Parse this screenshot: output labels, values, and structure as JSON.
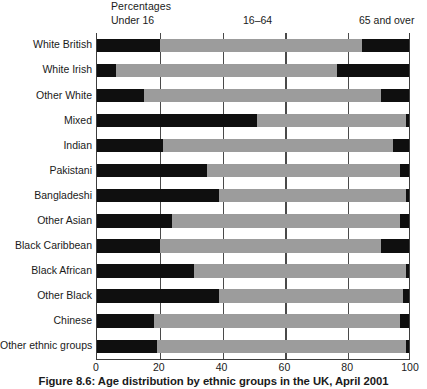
{
  "header": {
    "percentages_label": "Percentages",
    "band_labels": [
      "Under 16",
      "16–64",
      "65 and over"
    ]
  },
  "caption": "Figure 8.6: Age distribution by ethnic groups in the UK, April 2001",
  "colors": {
    "under16": "#0f0f0f",
    "age16to64": "#9c9c9c",
    "over65": "#0f0f0f",
    "axis": "#3d3d3d",
    "background": "#ffffff"
  },
  "chart_data": {
    "type": "bar",
    "orientation": "horizontal",
    "stacked": true,
    "title": "Figure 8.6: Age distribution by ethnic groups in the UK, April 2001",
    "xlabel": "Percentages",
    "ylabel": "",
    "xlim": [
      0,
      100
    ],
    "xticks": [
      0,
      20,
      40,
      60,
      80,
      100
    ],
    "grid": true,
    "legend": [
      "Under 16",
      "16–64",
      "65 and over"
    ],
    "legend_position": "top",
    "categories": [
      "White British",
      "White Irish",
      "Other White",
      "Mixed",
      "Indian",
      "Pakistani",
      "Bangladeshi",
      "Other Asian",
      "Black Caribbean",
      "Black African",
      "Other Black",
      "Chinese",
      "Other ethnic groups"
    ],
    "series": [
      {
        "name": "Under 16",
        "values": [
          20,
          6,
          15,
          51,
          21,
          35,
          39,
          24,
          20,
          31,
          39,
          18,
          19
        ]
      },
      {
        "name": "16–64",
        "values": [
          65,
          71,
          76,
          48,
          74,
          62,
          60,
          73,
          71,
          68,
          59,
          79,
          80
        ]
      },
      {
        "name": "65 and over",
        "values": [
          15,
          23,
          9,
          1,
          5,
          3,
          1,
          3,
          9,
          1,
          2,
          3,
          1
        ]
      }
    ]
  },
  "xtick_labels": [
    "0",
    "20",
    "40",
    "60",
    "80",
    "100"
  ]
}
